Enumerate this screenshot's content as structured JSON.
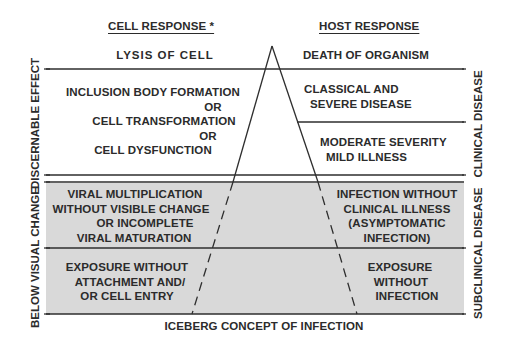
{
  "title": "ICEBERG CONCEPT OF INFECTION",
  "headers": {
    "cell": "CELL RESPONSE *",
    "host": "HOST RESPONSE"
  },
  "cell_levels": [
    {
      "lines": [
        "LYSIS OF CELL"
      ]
    },
    {
      "lines": [
        "INCLUSION BODY FORMATION",
        "OR",
        "CELL TRANSFORMATION",
        "OR",
        "CELL DYSFUNCTION"
      ]
    },
    {
      "lines": [
        "VIRAL MULTIPLICATION",
        "WITHOUT VISIBLE CHANGE",
        "OR INCOMPLETE",
        "VIRAL MATURATION"
      ]
    },
    {
      "lines": [
        "EXPOSURE WITHOUT",
        "ATTACHMENT AND/",
        "OR CELL ENTRY"
      ]
    }
  ],
  "host_levels": [
    {
      "lines": [
        "DEATH OF ORGANISM"
      ]
    },
    {
      "lines": [
        "CLASSICAL AND",
        "SEVERE DISEASE"
      ]
    },
    {
      "lines": [
        "MODERATE SEVERITY",
        "MILD ILLNESS"
      ]
    },
    {
      "lines": [
        "INFECTION WITHOUT",
        "CLINICAL ILLNESS",
        "(ASYMPTOMATIC",
        "INFECTION)"
      ]
    },
    {
      "lines": [
        "EXPOSURE",
        "WITHOUT",
        "INFECTION"
      ]
    }
  ],
  "left_axis": {
    "upper": "DISCERNABLE EFFECT",
    "lower": "BELOW VISUAL CHANGE"
  },
  "right_axis": {
    "upper": "CLINICAL DISEASE",
    "lower": "SUBCLINICAL DISEASE"
  },
  "colors": {
    "line": "#2e2e2e",
    "submerged_fill": "#d9d9d9",
    "background": "#ffffff",
    "text": "#2b2b2b"
  }
}
